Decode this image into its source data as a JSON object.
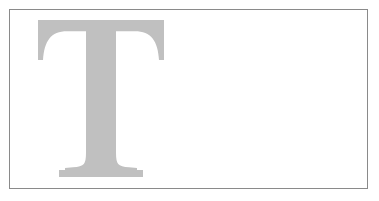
{
  "page": {
    "background_color": "#ffffff",
    "width": 379,
    "height": 201
  },
  "frame": {
    "name": "content-border-box",
    "border_color": "#8a8a8a",
    "border_width_px": 1,
    "fill_color": "#ffffff",
    "x": 9,
    "y": 9,
    "width": 359,
    "height": 180
  },
  "dropcap": {
    "character": "T",
    "label": "T",
    "color": "#c0c0c0",
    "style": "serif",
    "x": 38,
    "y": 20,
    "width": 126,
    "height": 157,
    "stem_width_px": 30,
    "bar_thickness_px": 10
  }
}
